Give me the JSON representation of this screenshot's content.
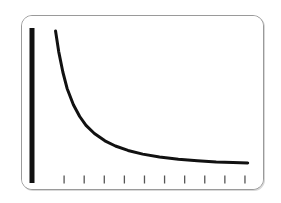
{
  "figure": {
    "title": "Decay Curve",
    "background_color": "#ffffff",
    "card": {
      "border_color": "#9a9a9a",
      "fill_color": "#ffffff",
      "corner_radius": "11px"
    },
    "ink_color": "#111111"
  },
  "chart_data": {
    "type": "line",
    "title": "",
    "subtitle": "",
    "xlabel": "",
    "ylabel": "",
    "grid": false,
    "legend": false,
    "legend_position": "none",
    "xlim": [
      0,
      10
    ],
    "ylim": [
      0,
      10
    ],
    "x_tick_labels": [
      "",
      "",
      "",
      "",
      "",
      "",
      "",
      "",
      "",
      ""
    ],
    "y_tick_labels": [],
    "x_tick_count": 10,
    "y_tick_count": 0,
    "axis_style": {
      "y_axis": "thick-solid-bar",
      "x_axis": "ticks-only",
      "y_axis_width_px": 5,
      "tick_length_px": 8,
      "tick_color": "#555555"
    },
    "series": [
      {
        "name": "decay",
        "color": "#111111",
        "line_width_px": 3,
        "x": [
          0.55,
          0.7,
          0.9,
          1.1,
          1.4,
          1.7,
          2.0,
          2.4,
          2.9,
          3.4,
          4.0,
          4.7,
          5.5,
          6.4,
          7.3,
          8.2,
          9.0,
          9.7
        ],
        "values": [
          9.8,
          8.4,
          7.0,
          5.9,
          4.8,
          4.0,
          3.4,
          2.85,
          2.35,
          2.0,
          1.7,
          1.45,
          1.25,
          1.1,
          1.0,
          0.92,
          0.88,
          0.85
        ]
      }
    ]
  }
}
